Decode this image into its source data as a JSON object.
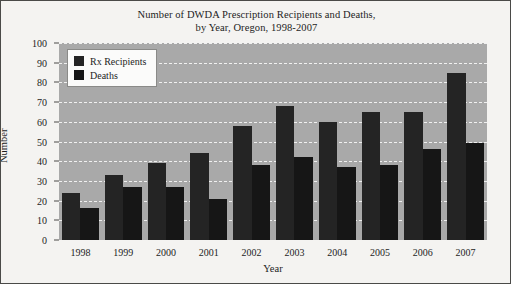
{
  "chart_data": {
    "type": "bar",
    "title": "Number of DWDA Prescription Recipients and Deaths,\nby Year, Oregon, 1998-2007",
    "title_lines": [
      "Number of DWDA Prescription Recipients and Deaths,",
      "by Year, Oregon, 1998-2007"
    ],
    "categories": [
      "1998",
      "1999",
      "2000",
      "2001",
      "2002",
      "2003",
      "2004",
      "2005",
      "2006",
      "2007"
    ],
    "series": [
      {
        "name": "Rx Recipients",
        "values": [
          24,
          33,
          39,
          44,
          58,
          68,
          60,
          65,
          65,
          85
        ],
        "color": "#242424"
      },
      {
        "name": "Deaths",
        "values": [
          16,
          27,
          27,
          21,
          38,
          42,
          37,
          38,
          46,
          49
        ],
        "color": "#161616"
      }
    ],
    "xlabel": "Year",
    "ylabel": "Number",
    "ylim": [
      0,
      100
    ],
    "yticks": [
      0,
      10,
      20,
      30,
      40,
      50,
      60,
      70,
      80,
      90,
      100
    ],
    "grid": true,
    "grid_color": "#f0f0f0",
    "plot_background": "#a9a9a9",
    "figure_background": "#f4f3f1",
    "legend_position": "upper left"
  }
}
